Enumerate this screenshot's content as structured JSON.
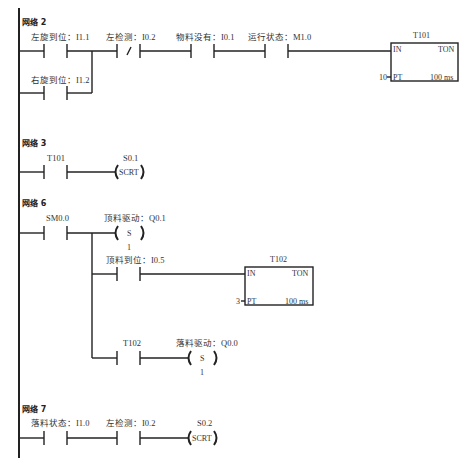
{
  "networks": [
    {
      "title": "网络 2",
      "contacts": [
        {
          "label": "左旋到位：I1.1",
          "type": "NO"
        },
        {
          "label": "右旋到位：I1.2",
          "type": "NO"
        },
        {
          "label": "左检测：I0.2",
          "type": "NC"
        },
        {
          "label": "物料没有：I0.1",
          "type": "NO"
        },
        {
          "label": "运行状态：M1.0",
          "type": "NO"
        }
      ],
      "timer": {
        "name": "T101",
        "type": "TON",
        "in": "IN",
        "pt_label": "PT",
        "pt_value": "10",
        "base": "100 ms"
      }
    },
    {
      "title": "网络 3",
      "contacts": [
        {
          "label": "T101",
          "type": "NO"
        }
      ],
      "coil": {
        "operand": "S0.1",
        "instr": "SCRT"
      }
    },
    {
      "title": "网络 6",
      "contacts": [
        {
          "label": "SM0.0",
          "type": "NO"
        },
        {
          "label": "顶料到位：I0.5",
          "type": "NO"
        },
        {
          "label": "T102",
          "type": "NO"
        }
      ],
      "set_coils": [
        {
          "operand": "顶料驱动：Q0.1",
          "instr": "S",
          "n": "1"
        },
        {
          "operand": "落料驱动：Q0.0",
          "instr": "S",
          "n": "1"
        }
      ],
      "timer": {
        "name": "T102",
        "type": "TON",
        "in": "IN",
        "pt_label": "PT",
        "pt_value": "3",
        "base": "100 ms"
      }
    },
    {
      "title": "网络 7",
      "contacts": [
        {
          "label": "落料状态：I1.0",
          "type": "NO"
        },
        {
          "label": "左检测：I0.2",
          "type": "NO"
        }
      ],
      "coil": {
        "operand": "S0.2",
        "instr": "SCRT"
      }
    }
  ]
}
